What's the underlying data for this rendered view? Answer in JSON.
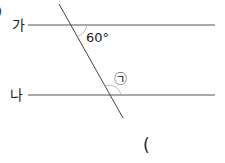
{
  "diagram": {
    "line_top_label": "가",
    "line_bottom_label": "나",
    "given_angle": "60°",
    "unknown_angle": "㉠",
    "answer_paren": "(",
    "edge_mark": ")"
  }
}
